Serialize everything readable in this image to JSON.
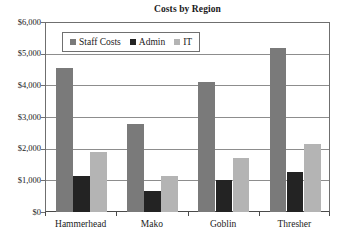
{
  "chart_data": {
    "type": "bar",
    "title": "Costs by Region",
    "xlabel": "",
    "ylabel": "",
    "categories": [
      "Hammerhead",
      "Mako",
      "Goblin",
      "Thresher"
    ],
    "series": [
      {
        "name": "Staff Costs",
        "color": "#7a7a7a",
        "values": [
          4580,
          2800,
          4120,
          5200
        ]
      },
      {
        "name": "Admin",
        "color": "#232323",
        "values": [
          1130,
          680,
          1010,
          1280
        ]
      },
      {
        "name": "IT",
        "color": "#b4b4b4",
        "values": [
          1900,
          1150,
          1700,
          2150
        ]
      }
    ],
    "ylim": [
      0,
      6000
    ],
    "ytick_values": [
      0,
      1000,
      2000,
      3000,
      4000,
      5000,
      6000
    ],
    "ytick_labels": [
      "$0",
      "$1,000",
      "$2,000",
      "$3,000",
      "$4,000",
      "$5,000",
      "$6,000"
    ],
    "grid": "horizontal",
    "legend_position": "upper-left-inside",
    "legend_boxed": true
  },
  "colors": {
    "background": "#ffffff",
    "axis": "#4a4a4a",
    "gridline": "#8d8d8d",
    "text": "#1b1b1b",
    "legend_border": "#707070"
  }
}
